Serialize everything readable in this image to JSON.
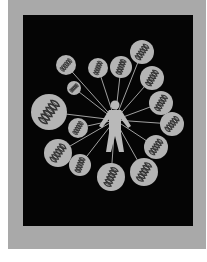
{
  "artwork": {
    "description": "Photograph of a black textile panel on a grey mount showing a human figure connected by lines to circles containing DNA double helices",
    "colors": {
      "background": "#ffffff",
      "mount": "#a9a9a9",
      "panel": "#050505",
      "circle_fill": "#b4b4b4",
      "helix": "#333333",
      "figure": "#b9b9b9",
      "line": "#a0a0a0"
    },
    "figure": {
      "cx": 115,
      "cy": 120
    },
    "circles": [
      {
        "cx": 66,
        "cy": 65,
        "r": 10,
        "angle": -50
      },
      {
        "cx": 98,
        "cy": 68,
        "r": 10,
        "angle": -70
      },
      {
        "cx": 121,
        "cy": 67,
        "r": 11,
        "angle": -70
      },
      {
        "cx": 142,
        "cy": 52,
        "r": 12,
        "angle": -55
      },
      {
        "cx": 152,
        "cy": 78,
        "r": 12,
        "angle": -60
      },
      {
        "cx": 74,
        "cy": 88,
        "r": 7,
        "angle": -45
      },
      {
        "cx": 49,
        "cy": 112,
        "r": 18,
        "angle": -55
      },
      {
        "cx": 161,
        "cy": 103,
        "r": 12,
        "angle": -60
      },
      {
        "cx": 172,
        "cy": 124,
        "r": 12,
        "angle": -50
      },
      {
        "cx": 78,
        "cy": 128,
        "r": 10,
        "angle": -60
      },
      {
        "cx": 58,
        "cy": 153,
        "r": 14,
        "angle": -55
      },
      {
        "cx": 80,
        "cy": 165,
        "r": 11,
        "angle": -70
      },
      {
        "cx": 156,
        "cy": 147,
        "r": 12,
        "angle": -55
      },
      {
        "cx": 111,
        "cy": 177,
        "r": 14,
        "angle": -65
      },
      {
        "cx": 144,
        "cy": 172,
        "r": 14,
        "angle": -60
      }
    ]
  }
}
